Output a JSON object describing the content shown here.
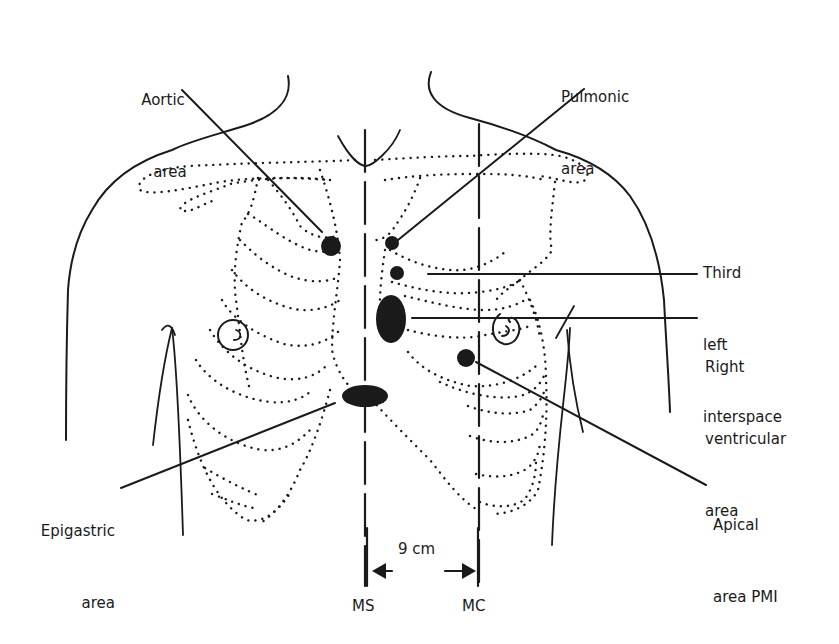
{
  "diagram": {
    "type": "anatomical-chest-auscultation-areas",
    "labels": {
      "aortic": [
        "Aortic",
        "area"
      ],
      "pulmonic": [
        "Pulmonic",
        "area"
      ],
      "third_left": [
        "Third",
        "left",
        "interspace"
      ],
      "right_ventricular": [
        "Right",
        "ventricular",
        "area"
      ],
      "epigastric": [
        "Epigastric",
        "area"
      ],
      "apical": [
        "Apical",
        "area PMI"
      ]
    },
    "reference_lines": {
      "midsternal": "MS",
      "midclavicular": "MC"
    },
    "distance": "9 cm",
    "colors": {
      "ink": "#1a1a1a",
      "background": "#ffffff"
    }
  }
}
